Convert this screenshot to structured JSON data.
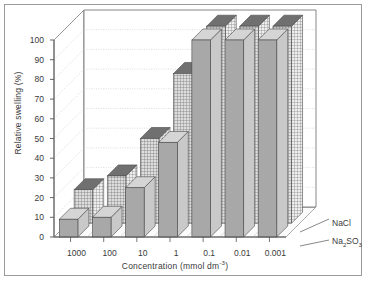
{
  "chart_data": {
    "type": "bar",
    "title": "",
    "subtitle": "",
    "xlabel": "Concentration (mmol dm",
    "xlabel_exponent": "-3",
    "xlabel_close": ")",
    "ylabel": "Relative swelling (%)",
    "categories": [
      "1000",
      "100",
      "10",
      "1",
      "0.1",
      "0.01",
      "0.001"
    ],
    "ylim": [
      0,
      100
    ],
    "yticks": [
      "0",
      "10",
      "20",
      "30",
      "40",
      "50",
      "60",
      "70",
      "80",
      "90",
      "100"
    ],
    "grid": true,
    "legend_position": "right",
    "projection": "3d",
    "series": [
      {
        "name": "NaCl",
        "style": "solid-grey",
        "values": [
          9,
          10,
          25,
          48,
          100,
          100,
          100
        ]
      },
      {
        "name": "Na2SO3",
        "name_parts": {
          "prefix": "Na",
          "sub1": "2",
          "mid": "SO",
          "sub2": "3"
        },
        "style": "cross-hatched",
        "values": [
          17,
          24,
          43,
          76,
          100,
          100,
          100
        ]
      }
    ]
  },
  "legend": {
    "items": [
      {
        "label": "NaCl"
      },
      {
        "label": "Na2SO3"
      }
    ]
  },
  "colors": {
    "bar_front": "#a8a8a8",
    "bar_top": "#707070",
    "bar_side": "#c9c9c9",
    "hatch_face": "#dcdcdc",
    "hatch_line": "#6f6f6f",
    "axis": "#555555",
    "grid": "#c4c4c4",
    "text": "#3a3a3a",
    "frame": "#9a9a9a",
    "background": "#ffffff"
  }
}
